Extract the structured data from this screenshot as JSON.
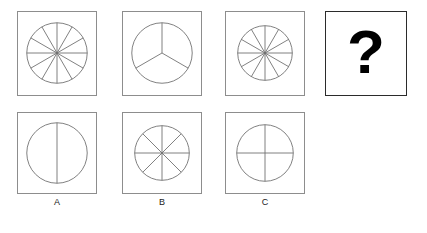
{
  "puzzle": {
    "type": "figure-series-matrix",
    "background_color": "#ffffff",
    "figure_stroke_color": "#6f6f6f",
    "box_border_color": "#8d8d8d",
    "unknown_box_border_color": "#2b2b2b",
    "sequence_row": {
      "name": "problem-sequence",
      "cells": [
        {
          "id": "seq-1",
          "name": "sequence-cell-1",
          "figure": "circle-divided",
          "sectors": 6,
          "divider_angles_deg": [
            0,
            30,
            60,
            90,
            120,
            150
          ],
          "box": {
            "x": 17,
            "y": 11,
            "w": 80,
            "h": 85
          },
          "circle": {
            "cx": 40,
            "cy": 42,
            "r": 31
          }
        },
        {
          "id": "seq-2",
          "name": "sequence-cell-2",
          "figure": "circle-divided",
          "sectors": 3,
          "radius_angles_deg": [
            90,
            210,
            330
          ],
          "box": {
            "x": 122,
            "y": 11,
            "w": 80,
            "h": 85
          },
          "circle": {
            "cx": 40,
            "cy": 42,
            "r": 31
          }
        },
        {
          "id": "seq-3",
          "name": "sequence-cell-3",
          "figure": "circle-divided",
          "sectors": 6,
          "divider_angles_deg": [
            0,
            30,
            60,
            90,
            120,
            150
          ],
          "box": {
            "x": 225,
            "y": 11,
            "w": 80,
            "h": 85
          },
          "circle": {
            "cx": 40,
            "cy": 42,
            "r": 28
          }
        },
        {
          "id": "seq-4",
          "name": "unknown-cell",
          "figure": "question-mark",
          "glyph": "?",
          "box": {
            "x": 325,
            "y": 11,
            "w": 82,
            "h": 85
          }
        }
      ]
    },
    "options_row": {
      "name": "answer-options",
      "cells": [
        {
          "id": "opt-a",
          "name": "option-a",
          "label": "A",
          "figure": "circle-divided",
          "sectors": 2,
          "divider_angles_deg": [
            90
          ],
          "box": {
            "x": 17,
            "y": 112,
            "w": 80,
            "h": 82
          },
          "circle": {
            "cx": 40,
            "cy": 41,
            "r": 31
          }
        },
        {
          "id": "opt-b",
          "name": "option-b",
          "label": "B",
          "figure": "circle-divided",
          "sectors": 8,
          "divider_angles_deg": [
            0,
            45,
            90,
            135
          ],
          "box": {
            "x": 122,
            "y": 112,
            "w": 80,
            "h": 82
          },
          "circle": {
            "cx": 40,
            "cy": 41,
            "r": 28
          }
        },
        {
          "id": "opt-c",
          "name": "option-c",
          "label": "C",
          "figure": "circle-divided",
          "sectors": 4,
          "divider_angles_deg": [
            0,
            90
          ],
          "box": {
            "x": 225,
            "y": 112,
            "w": 80,
            "h": 82
          },
          "circle": {
            "cx": 40,
            "cy": 41,
            "r": 29
          }
        }
      ]
    },
    "labels": [
      {
        "name": "option-label-a",
        "text": "A",
        "x": 17,
        "y": 198,
        "w": 80
      },
      {
        "name": "option-label-b",
        "text": "B",
        "x": 122,
        "y": 198,
        "w": 80
      },
      {
        "name": "option-label-c",
        "text": "C",
        "x": 225,
        "y": 198,
        "w": 80
      }
    ]
  }
}
